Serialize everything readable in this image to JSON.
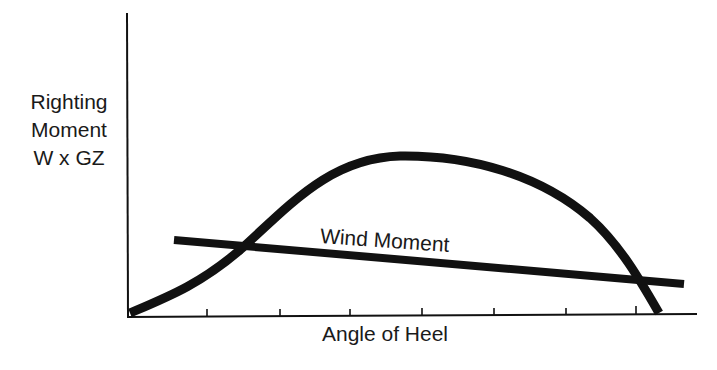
{
  "diagram": {
    "type": "stability-curve",
    "y_axis_label": [
      "Righting",
      "Moment",
      "W x GZ"
    ],
    "x_axis_label": "Angle of Heel",
    "curves": [
      {
        "name": "Righting Moment Curve",
        "label": ""
      },
      {
        "name": "Wind Moment",
        "label": "Wind Moment"
      }
    ],
    "x_ticks_count": 7,
    "colors": {
      "ink": "#111111",
      "background": "#ffffff"
    }
  }
}
